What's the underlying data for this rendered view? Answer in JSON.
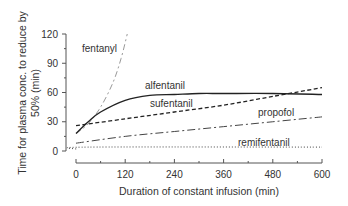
{
  "chart_data": {
    "type": "line",
    "title": "",
    "xlabel": "Duration of constant infusion (min)",
    "ylabel_line1": "Time for plasma conc. to reduce by",
    "ylabel_line2": "50% (min)",
    "xlim": [
      0,
      600
    ],
    "ylim": [
      0,
      120
    ],
    "xticks": [
      0,
      120,
      240,
      360,
      480,
      600
    ],
    "yticks": [
      0,
      30,
      60,
      90,
      120
    ],
    "grid": false,
    "legend": "inline labels",
    "series": [
      {
        "name": "fentanyl",
        "style": "dash-dot-light",
        "x": [
          0,
          30,
          60,
          90,
          110,
          125
        ],
        "y": [
          18,
          28,
          45,
          70,
          95,
          120
        ]
      },
      {
        "name": "alfentanil",
        "style": "solid",
        "x": [
          0,
          30,
          60,
          120,
          180,
          240,
          300,
          360,
          480,
          600
        ],
        "y": [
          18,
          30,
          40,
          52,
          57,
          58,
          59,
          59,
          59,
          58
        ]
      },
      {
        "name": "sufentanil",
        "style": "dashed",
        "x": [
          0,
          120,
          240,
          360,
          480,
          600
        ],
        "y": [
          26,
          33,
          40,
          47,
          56,
          65
        ]
      },
      {
        "name": "propofol",
        "style": "dash-dot",
        "x": [
          0,
          120,
          240,
          360,
          480,
          600
        ],
        "y": [
          8,
          15,
          20,
          25,
          30,
          35
        ]
      },
      {
        "name": "remifentanil",
        "style": "dotted",
        "x": [
          0,
          30,
          600
        ],
        "y": [
          2,
          4,
          4
        ]
      }
    ],
    "labels": {
      "fentanyl": "fentanyl",
      "alfentanil": "alfentanil",
      "sufentanil": "sufentanil",
      "propofol": "propofol",
      "remifentanil": "remifentanil"
    }
  }
}
